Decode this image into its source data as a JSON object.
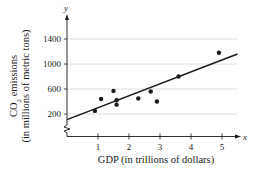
{
  "chart_data": {
    "type": "scatter",
    "title": "",
    "xlabel": "GDP (in trillions of dollars)",
    "ylabel": "CO2 emissions (in millions of metric tons)",
    "ylabel_line1": "CO",
    "ylabel_sub": "2",
    "ylabel_line1_rest": " emissions",
    "ylabel_line2": "(in millions of metric tons)",
    "x_axis_var": "x",
    "y_axis_var": "y",
    "x_ticks": [
      1,
      2,
      3,
      4,
      5
    ],
    "y_ticks": [
      200,
      600,
      1000,
      1400
    ],
    "xlim": [
      0,
      5.5
    ],
    "ylim": [
      0,
      1500
    ],
    "y_axis_break": true,
    "grid": {
      "horizontal": true,
      "vertical": false
    },
    "legend": null,
    "series": [
      {
        "name": "data points",
        "points": [
          {
            "x": 0.9,
            "y": 250
          },
          {
            "x": 1.1,
            "y": 440
          },
          {
            "x": 1.5,
            "y": 570
          },
          {
            "x": 1.6,
            "y": 420
          },
          {
            "x": 1.6,
            "y": 350
          },
          {
            "x": 2.3,
            "y": 450
          },
          {
            "x": 2.7,
            "y": 560
          },
          {
            "x": 2.9,
            "y": 400
          },
          {
            "x": 3.6,
            "y": 800
          },
          {
            "x": 4.9,
            "y": 1180
          }
        ]
      }
    ],
    "regression_line": {
      "x1": 0,
      "y1": 110,
      "x2": 5.5,
      "y2": 1160
    }
  },
  "colors": {
    "ink": "#1a1a1a",
    "grid": "#d6d6d6",
    "background": "#ffffff"
  }
}
